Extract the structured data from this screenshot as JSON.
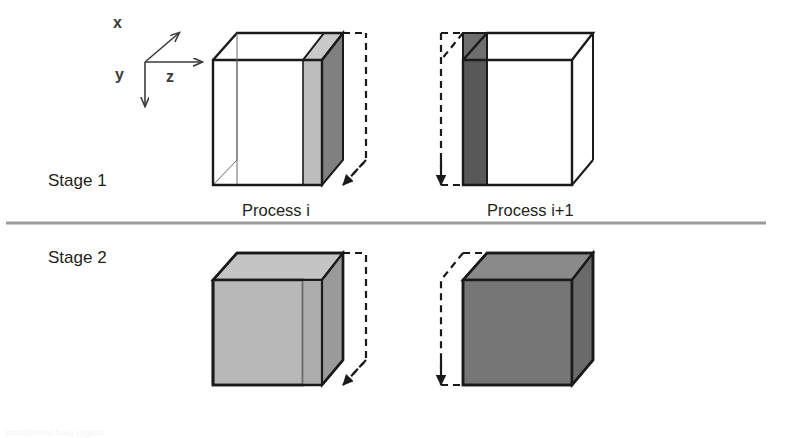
{
  "figure": {
    "background": "#ffffff"
  },
  "axes": {
    "name": "coordinate-axes",
    "origin": {
      "x": 145,
      "y": 62
    },
    "labels": {
      "x": "x",
      "y": "y",
      "z": "z"
    },
    "x_label_pos": {
      "x": 113,
      "y": 22
    },
    "y_label_pos": {
      "x": 117,
      "y": 78
    },
    "z_label_pos": {
      "x": 168,
      "y": 82
    },
    "x_tip": {
      "x": 180,
      "y": 32
    },
    "y_tip": {
      "x": 145,
      "y": 108
    },
    "z_tip": {
      "x": 203,
      "y": 62
    },
    "stroke": "#3b3b3b"
  },
  "rows": [
    {
      "id": "stage-1",
      "label": "Stage 1",
      "label_pos": {
        "x": 48,
        "y": 186
      },
      "cells": [
        {
          "id": "stage1-process-i",
          "caption": "Process i",
          "caption_pos": {
            "x": 242,
            "y": 216
          },
          "body_fill": "none",
          "top_fill": "none",
          "side_fill": "none",
          "slab_side": "right",
          "slab_front_fill": "#bdbdbd",
          "slab_top_fill": "#c9c9c9",
          "slab_depth_fill": "#808080",
          "ghost_side": "right"
        },
        {
          "id": "stage1-process-i-plus-1",
          "caption": "Process i+1",
          "caption_pos": {
            "x": 487,
            "y": 216
          },
          "body_fill": "none",
          "top_fill": "none",
          "side_fill": "none",
          "slab_side": "left",
          "slab_front_fill": "#585858",
          "slab_top_fill": "#6e6e6e",
          "slab_depth_fill": "#4d4d4d",
          "ghost_side": "left"
        }
      ]
    },
    {
      "id": "stage-2",
      "label": "Stage 2",
      "label_pos": {
        "x": 48,
        "y": 263
      },
      "cells": [
        {
          "id": "stage2-process-i",
          "caption": "",
          "caption_pos": {
            "x": 242,
            "y": 430
          },
          "body_fill": "#b8b8b8",
          "top_fill": "#c4c4c4",
          "side_fill": "#a8a8a8",
          "slab_side": "right",
          "slab_front_fill": "#adadad",
          "slab_top_fill": "#bcbcbc",
          "slab_depth_fill": "#9a9a9a",
          "ghost_side": "right"
        },
        {
          "id": "stage2-process-i-plus-1",
          "caption": "",
          "caption_pos": {
            "x": 487,
            "y": 430
          },
          "body_fill": "#767676",
          "top_fill": "#8a8a8a",
          "side_fill": "#6a6a6a",
          "slab_side": "none",
          "slab_front_fill": "#767676",
          "slab_top_fill": "#8a8a8a",
          "slab_depth_fill": "#6a6a6a",
          "ghost_side": "left"
        }
      ]
    }
  ],
  "divider": {
    "name": "stage-divider",
    "color": "#9b9b9b",
    "y": 222,
    "x1": 6,
    "x2": 766,
    "thickness": 3
  },
  "strokes": {
    "outline_dark": "#1a1a1a",
    "outline_thin": "#555555",
    "dashed": "#1a1a1a"
  },
  "footer": {
    "cut_text": "transferred halo region"
  }
}
